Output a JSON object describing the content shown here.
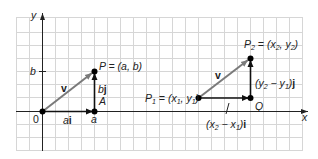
{
  "diagram": {
    "colors": {
      "grid": "#d4d4d4",
      "axis": "#222222",
      "vector_v": "#7a7a7a",
      "component": "#111111",
      "point": "#000000"
    },
    "axes": {
      "x_label": "x",
      "y_label": "y",
      "origin_label": "0"
    },
    "left": {
      "vector_label": "v",
      "point_P_label": "P = (a, b)",
      "point_A_label": "A",
      "tick_b_label": "b",
      "tick_a_label": "a",
      "horizontal_component_label": "ai",
      "vertical_component_label": "bj"
    },
    "right": {
      "vector_label": "v",
      "P1": {
        "name": "P",
        "sub": "1",
        "eq": " = (x",
        "x_sub": "1",
        "comma": ", y",
        "y_sub": "1",
        "close": ")"
      },
      "P2": {
        "name": "P",
        "sub": "2",
        "eq": " = (x",
        "x_sub": "2",
        "comma": ", y",
        "y_sub": "2",
        "close": ")"
      },
      "point_Q_label": "Q",
      "vertical_component": {
        "open": "(y",
        "a_sub": "2",
        "minus": " − y",
        "b_sub": "1",
        "close": ")",
        "unit": "j"
      },
      "horizontal_component": {
        "open": "(x",
        "a_sub": "2",
        "minus": " − x",
        "b_sub": "1",
        "close": ")",
        "unit": "i"
      }
    }
  }
}
